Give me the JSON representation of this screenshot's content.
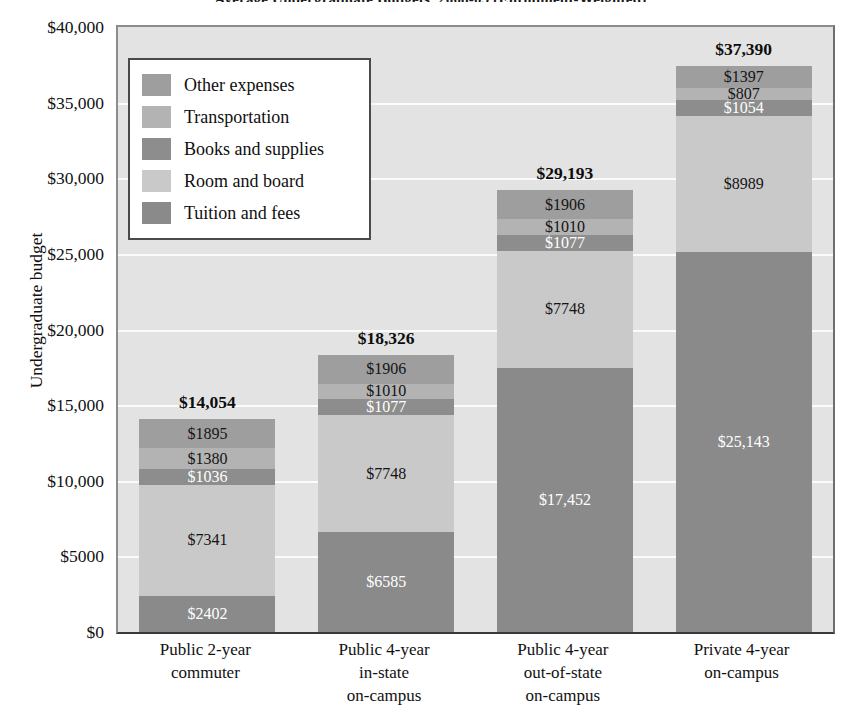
{
  "chart_data": {
    "type": "bar",
    "subtype": "stacked-bar",
    "title": "Average Undergraduate Budgets, 2008-09 (Enrollment-Weighted)",
    "xlabel": "",
    "ylabel": "Undergraduate budget",
    "ylim": [
      0,
      40000
    ],
    "ytick_values": [
      0,
      5000,
      10000,
      15000,
      20000,
      25000,
      30000,
      35000,
      40000
    ],
    "ytick_labels": [
      "$0",
      "$5000",
      "$10,000",
      "$15,000",
      "$20,000",
      "$25,000",
      "$30,000",
      "$35,000",
      "$40,000"
    ],
    "grid": true,
    "grid_color": "#fbfbfb",
    "plot_background": "#e3e3e3",
    "legend_position": "upper left",
    "stack_order_bottom_to_top": [
      "Tuition and fees",
      "Room and board",
      "Books and supplies",
      "Transportation",
      "Other expenses"
    ],
    "categories": [
      {
        "lines": [
          "Public 2-year",
          "commuter"
        ],
        "total": 14054,
        "total_label": "$14,054"
      },
      {
        "lines": [
          "Public 4-year",
          "in-state",
          "on-campus"
        ],
        "total": 18326,
        "total_label": "$18,326"
      },
      {
        "lines": [
          "Public 4-year",
          "out-of-state",
          "on-campus"
        ],
        "total": 29193,
        "total_label": "$29,193"
      },
      {
        "lines": [
          "Private 4-year",
          "on-campus"
        ],
        "total": 37390,
        "total_label": "$37,390"
      }
    ],
    "series": [
      {
        "name": "Tuition and fees",
        "color": "#8a8a8a",
        "label_color": "light",
        "values": [
          2402,
          6585,
          17452,
          25143
        ],
        "labels": [
          "$2402",
          "$6585",
          "$17,452",
          "$25,143"
        ]
      },
      {
        "name": "Room and board",
        "color": "#c9c9c9",
        "label_color": "dark",
        "values": [
          7341,
          7748,
          7748,
          8989
        ],
        "labels": [
          "$7341",
          "$7748",
          "$7748",
          "$8989"
        ]
      },
      {
        "name": "Books and supplies",
        "color": "#8d8d8d",
        "label_color": "light",
        "values": [
          1036,
          1077,
          1077,
          1054
        ],
        "labels": [
          "$1036",
          "$1077",
          "$1077",
          "$1054"
        ]
      },
      {
        "name": "Transportation",
        "color": "#b3b3b3",
        "label_color": "dark",
        "values": [
          1380,
          1010,
          1010,
          807
        ],
        "labels": [
          "$1380",
          "$1010",
          "$1010",
          "$807"
        ]
      },
      {
        "name": "Other expenses",
        "color": "#9e9e9e",
        "label_color": "dark",
        "values": [
          1895,
          1906,
          1906,
          1397
        ],
        "labels": [
          "$1895",
          "$1906",
          "$1906",
          "$1397"
        ]
      }
    ],
    "legend_entries": [
      {
        "label": "Other expenses",
        "color": "#9e9e9e"
      },
      {
        "label": "Transportation",
        "color": "#b3b3b3"
      },
      {
        "label": "Books and supplies",
        "color": "#8d8d8d"
      },
      {
        "label": "Room and board",
        "color": "#c9c9c9"
      },
      {
        "label": "Tuition and fees",
        "color": "#8a8a8a"
      }
    ]
  }
}
